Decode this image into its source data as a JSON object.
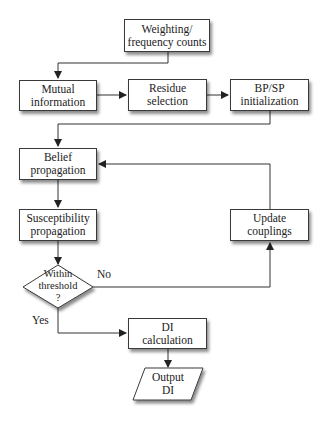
{
  "diagram": {
    "type": "flowchart",
    "nodes": [
      {
        "id": "weighting",
        "shape": "rect",
        "line1": "Weighting/",
        "line2": "frequency counts"
      },
      {
        "id": "mutual",
        "shape": "rect",
        "line1": "Mutual",
        "line2": "information"
      },
      {
        "id": "residue",
        "shape": "rect",
        "line1": "Residue",
        "line2": "selection"
      },
      {
        "id": "bpsp",
        "shape": "rect",
        "line1": "BP/SP",
        "line2": "initialization"
      },
      {
        "id": "belief",
        "shape": "rect",
        "line1": "Belief",
        "line2": "propagation"
      },
      {
        "id": "suscept",
        "shape": "rect",
        "line1": "Susceptibility",
        "line2": "propagation"
      },
      {
        "id": "update",
        "shape": "rect",
        "line1": "Update",
        "line2": "couplings"
      },
      {
        "id": "threshold",
        "shape": "diamond",
        "line1": "Within",
        "line2": "threshold",
        "line3": "?"
      },
      {
        "id": "dicalc",
        "shape": "rect",
        "line1": "DI",
        "line2": "calculation"
      },
      {
        "id": "output",
        "shape": "parallelogram",
        "line1": "Output",
        "line2": "DI"
      }
    ],
    "edges": [
      {
        "from": "weighting",
        "to": "mutual"
      },
      {
        "from": "mutual",
        "to": "residue"
      },
      {
        "from": "residue",
        "to": "bpsp"
      },
      {
        "from": "bpsp",
        "to": "belief"
      },
      {
        "from": "belief",
        "to": "suscept"
      },
      {
        "from": "suscept",
        "to": "threshold"
      },
      {
        "from": "threshold",
        "to": "update",
        "label": "No"
      },
      {
        "from": "update",
        "to": "belief"
      },
      {
        "from": "threshold",
        "to": "dicalc",
        "label": "Yes"
      },
      {
        "from": "dicalc",
        "to": "output"
      }
    ],
    "labels": {
      "no": "No",
      "yes": "Yes"
    }
  }
}
